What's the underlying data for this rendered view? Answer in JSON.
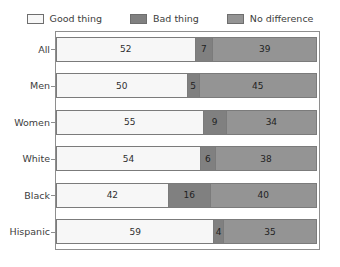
{
  "chart_data": {
    "type": "bar",
    "orientation": "horizontal",
    "stacked": true,
    "title": "",
    "subtitle": "",
    "xlabel": "",
    "ylabel": "",
    "xlim": [
      0,
      100
    ],
    "grid": false,
    "legend_position": "top",
    "categories": [
      "All",
      "Men",
      "Women",
      "White",
      "Black",
      "Hispanic"
    ],
    "series": [
      {
        "name": "Good thing",
        "color": "#f7f7f7",
        "values": [
          52,
          50,
          55,
          54,
          42,
          59
        ]
      },
      {
        "name": "Bad thing",
        "color": "#808080",
        "values": [
          7,
          5,
          9,
          6,
          16,
          4
        ]
      },
      {
        "name": "No difference",
        "color": "#949494",
        "values": [
          39,
          45,
          34,
          38,
          40,
          35
        ]
      }
    ],
    "rows": [
      {
        "label": "All",
        "segments": [
          {
            "series": "Good thing",
            "value": 52
          },
          {
            "series": "Bad thing",
            "value": 7
          },
          {
            "series": "No difference",
            "value": 39
          }
        ]
      },
      {
        "label": "Men",
        "segments": [
          {
            "series": "Good thing",
            "value": 50
          },
          {
            "series": "Bad thing",
            "value": 5
          },
          {
            "series": "No difference",
            "value": 45
          }
        ]
      },
      {
        "label": "Women",
        "segments": [
          {
            "series": "Good thing",
            "value": 55
          },
          {
            "series": "Bad thing",
            "value": 9
          },
          {
            "series": "No difference",
            "value": 34
          }
        ]
      },
      {
        "label": "White",
        "segments": [
          {
            "series": "Good thing",
            "value": 54
          },
          {
            "series": "Bad thing",
            "value": 6
          },
          {
            "series": "No difference",
            "value": 38
          }
        ]
      },
      {
        "label": "Black",
        "segments": [
          {
            "series": "Good thing",
            "value": 42
          },
          {
            "series": "Bad thing",
            "value": 16
          },
          {
            "series": "No difference",
            "value": 40
          }
        ]
      },
      {
        "label": "Hispanic",
        "segments": [
          {
            "series": "Good thing",
            "value": 59
          },
          {
            "series": "Bad thing",
            "value": 4
          },
          {
            "series": "No difference",
            "value": 35
          }
        ]
      }
    ]
  },
  "legend": {
    "entries": [
      {
        "label": "Good thing",
        "color": "#f7f7f7"
      },
      {
        "label": "Bad thing",
        "color": "#808080"
      },
      {
        "label": "No difference",
        "color": "#949494"
      }
    ]
  }
}
